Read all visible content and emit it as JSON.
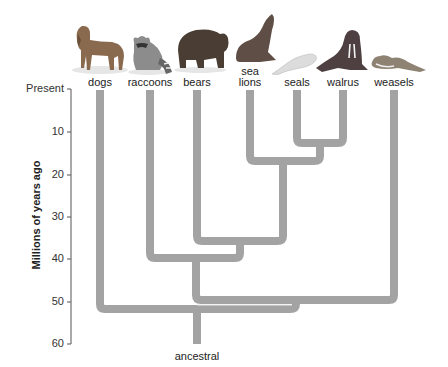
{
  "diagram": {
    "type": "phylogenetic-tree",
    "y_axis": {
      "label": "Millions of years ago",
      "ticks": [
        {
          "label": "Present",
          "value": 0
        },
        {
          "label": "10",
          "value": 10
        },
        {
          "label": "20",
          "value": 20
        },
        {
          "label": "30",
          "value": 30
        },
        {
          "label": "40",
          "value": 40
        },
        {
          "label": "50",
          "value": 50
        },
        {
          "label": "60",
          "value": 60
        }
      ]
    },
    "taxa": [
      {
        "name": "dogs",
        "icon": "dog-icon"
      },
      {
        "name": "raccoons",
        "icon": "raccoon-icon"
      },
      {
        "name": "bears",
        "icon": "bear-icon"
      },
      {
        "name": "sea lions",
        "line1": "sea",
        "line2": "lions",
        "icon": "sea-lion-icon"
      },
      {
        "name": "seals",
        "icon": "seal-icon"
      },
      {
        "name": "walrus",
        "icon": "walrus-icon"
      },
      {
        "name": "weasels",
        "icon": "weasel-icon"
      }
    ],
    "root_label": "ancestral",
    "branch_points_mya": {
      "seals_walrus": 13,
      "sea_lions_seals_walrus": 17,
      "bears_pinnipeds": 36,
      "raccoons_bears_group": 41,
      "weasels_join": 50,
      "dogs_join": 52,
      "root": 60
    },
    "colors": {
      "branch": "#a3a3a3",
      "axis": "#555555",
      "text": "#222222"
    }
  }
}
